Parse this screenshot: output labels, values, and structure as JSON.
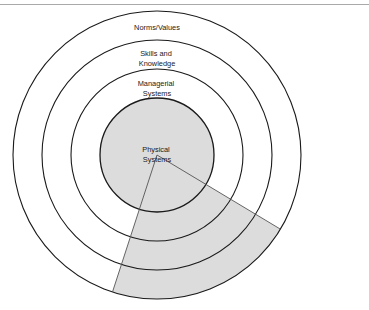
{
  "figure": {
    "type": "concentric-circles-diagram",
    "title": "",
    "background_color": "#ffffff",
    "stroke_color": "#1a1a1a",
    "shade_color": "#dcdcdc",
    "rule_color": "#a9a9a9",
    "center": {
      "x": 157,
      "y": 155
    },
    "rings": [
      {
        "name": "physical-systems",
        "label_lines": [
          "Physical",
          "Systems"
        ],
        "radius": 57,
        "filled": true,
        "label_x": 157,
        "label_y": 152
      },
      {
        "name": "managerial-systems",
        "label_lines": [
          "Managerial",
          "Systems"
        ],
        "radius": 86,
        "filled": false,
        "label_x": 157,
        "label_y": 86
      },
      {
        "name": "skills-and-knowledge",
        "label_lines": [
          "Skills and",
          "Knowledge"
        ],
        "radius": 115,
        "filled": false,
        "label_x": 157,
        "label_y": 56
      },
      {
        "name": "norms-values",
        "label_lines": [
          "Norms/Values"
        ],
        "radius": 144,
        "filled": false,
        "label_x": 157,
        "label_y": 30
      }
    ],
    "wedge": {
      "name": "shaded-sector",
      "start_angle_deg": 31,
      "end_angle_deg": 108,
      "fill": "#dcdcdc",
      "stroke": "#555555"
    }
  }
}
